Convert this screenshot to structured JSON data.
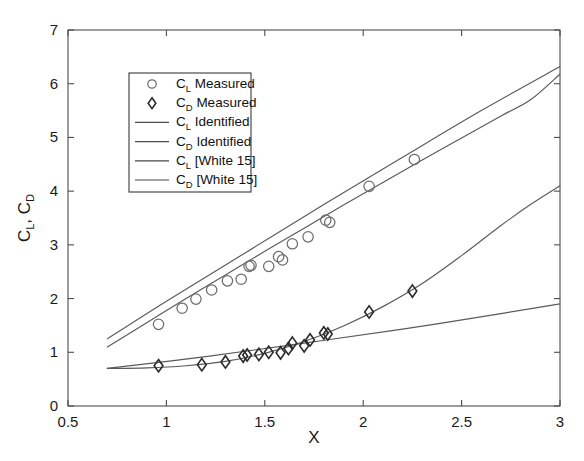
{
  "chart_data": {
    "type": "scatter",
    "title": "",
    "xlabel": "X",
    "ylabel": "C_L , C_D",
    "ylabel_parts": [
      "C",
      "L",
      ", C",
      "D"
    ],
    "xlim": [
      0.5,
      3
    ],
    "ylim": [
      0,
      7
    ],
    "xticks": [
      0.5,
      1,
      1.5,
      2,
      2.5,
      3
    ],
    "xticklabels": [
      "0.5",
      "1",
      "1.5",
      "2",
      "2.5",
      "3"
    ],
    "yticks": [
      0,
      1,
      2,
      3,
      4,
      5,
      6,
      7
    ],
    "yticklabels": [
      "0",
      "1",
      "2",
      "3",
      "4",
      "5",
      "6",
      "7"
    ],
    "grid": false,
    "legend_position": "upper-left-inside",
    "series": [
      {
        "name": "C_L Measured",
        "marker": "circle",
        "style": "markers",
        "color": "#6d6d6d",
        "points": [
          [
            0.96,
            1.52
          ],
          [
            1.08,
            1.82
          ],
          [
            1.15,
            1.99
          ],
          [
            1.23,
            2.16
          ],
          [
            1.31,
            2.33
          ],
          [
            1.38,
            2.36
          ],
          [
            1.42,
            2.6
          ],
          [
            1.43,
            2.62
          ],
          [
            1.52,
            2.6
          ],
          [
            1.57,
            2.78
          ],
          [
            1.59,
            2.72
          ],
          [
            1.64,
            3.02
          ],
          [
            1.72,
            3.15
          ],
          [
            1.81,
            3.46
          ],
          [
            1.83,
            3.42
          ],
          [
            2.03,
            4.09
          ],
          [
            2.26,
            4.59
          ]
        ]
      },
      {
        "name": "C_D Measured",
        "marker": "diamond",
        "style": "markers",
        "color": "#2b2b2b",
        "points": [
          [
            0.96,
            0.75
          ],
          [
            1.18,
            0.77
          ],
          [
            1.3,
            0.82
          ],
          [
            1.39,
            0.93
          ],
          [
            1.41,
            0.95
          ],
          [
            1.47,
            0.96
          ],
          [
            1.52,
            1.0
          ],
          [
            1.58,
            0.99
          ],
          [
            1.62,
            1.07
          ],
          [
            1.64,
            1.17
          ],
          [
            1.7,
            1.12
          ],
          [
            1.73,
            1.23
          ],
          [
            1.8,
            1.36
          ],
          [
            1.82,
            1.34
          ],
          [
            2.03,
            1.75
          ],
          [
            2.25,
            2.14
          ]
        ]
      },
      {
        "name": "C_L Identified",
        "style": "line",
        "color": "#5a5a5a",
        "x": [
          0.7,
          0.9,
          1.1,
          1.3,
          1.5,
          1.7,
          1.9,
          2.1,
          2.3,
          2.5,
          2.7,
          2.85,
          3.0
        ],
        "y": [
          1.1,
          1.55,
          2.0,
          2.44,
          2.88,
          3.31,
          3.74,
          4.16,
          4.58,
          4.99,
          5.4,
          5.7,
          6.18
        ]
      },
      {
        "name": "C_D Identified",
        "style": "line",
        "color": "#5a5a5a",
        "x": [
          0.7,
          0.9,
          1.1,
          1.3,
          1.5,
          1.7,
          1.9,
          2.1,
          2.3,
          2.5,
          2.7,
          2.85,
          3.0
        ],
        "y": [
          0.7,
          0.71,
          0.75,
          0.83,
          0.98,
          1.2,
          1.49,
          1.85,
          2.28,
          2.8,
          3.36,
          3.75,
          4.1
        ]
      },
      {
        "name": "C_L [White 15]",
        "style": "line",
        "color": "#5a5a5a",
        "x": [
          0.7,
          1.0,
          1.4,
          1.8,
          2.2,
          2.6,
          3.0
        ],
        "y": [
          1.25,
          1.95,
          2.85,
          3.75,
          4.63,
          5.5,
          6.32
        ]
      },
      {
        "name": "C_D [White 15]",
        "style": "line",
        "color": "#5a5a5a",
        "x": [
          0.7,
          1.2,
          1.7,
          2.2,
          2.7,
          3.0
        ],
        "y": [
          0.7,
          0.92,
          1.17,
          1.43,
          1.72,
          1.9
        ]
      }
    ]
  },
  "legend": {
    "entries": [
      {
        "sym": "circle",
        "main": "C",
        "sub": "L",
        "tail": "Measured"
      },
      {
        "sym": "diamond",
        "main": "C",
        "sub": "D",
        "tail": "Measured"
      },
      {
        "sym": "line",
        "main": "C",
        "sub": "L",
        "tail": "Identified"
      },
      {
        "sym": "line",
        "main": "C",
        "sub": "D",
        "tail": "Identified"
      },
      {
        "sym": "line",
        "main": "C",
        "sub": "L",
        "tail": "[White 15]"
      },
      {
        "sym": "line",
        "main": "C",
        "sub": "D",
        "tail": "[White 15]"
      }
    ]
  },
  "axes": {
    "x_label": "X",
    "y_label_main1": "C",
    "y_label_sub1": "L",
    "y_label_mid": ", C",
    "y_label_sub2": "D"
  },
  "colors": {
    "axis": "#4d4d4d",
    "line": "#5a5a5a",
    "circle_marker": "#6d6d6d",
    "diamond_marker": "#2b2b2b",
    "background": "#ffffff",
    "text": "#1a1a1a"
  }
}
